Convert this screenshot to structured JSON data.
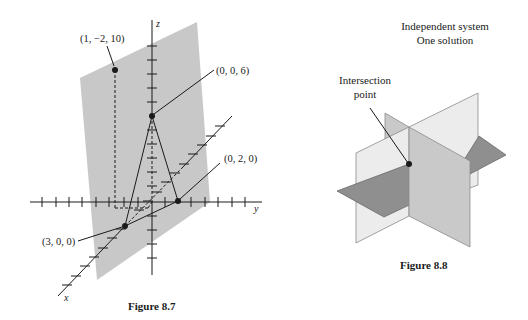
{
  "figure_8_7": {
    "caption": "Figure 8.7",
    "axes": {
      "x_label": "x",
      "y_label": "y",
      "z_label": "z"
    },
    "points": [
      {
        "label": "(1, −2, 10)",
        "coords": [
          1,
          -2,
          10
        ]
      },
      {
        "label": "(0, 0, 6)",
        "coords": [
          0,
          0,
          6
        ]
      },
      {
        "label": "(0,  2,  0)",
        "coords": [
          0,
          2,
          0
        ]
      },
      {
        "label": "(3, 0, 0)",
        "coords": [
          3,
          0,
          0
        ]
      }
    ],
    "colors": {
      "plane": "#c8c8c8",
      "ink": "#1a1a1a"
    }
  },
  "figure_8_8": {
    "caption": "Figure 8.8",
    "title_line1": "Independent system",
    "title_line2": "One solution",
    "annotation_line1": "Intersection",
    "annotation_line2": "point",
    "colors": {
      "light_plane": "#ececec",
      "mid_plane": "#c9c9c9",
      "dark_plane": "#8f8f8f"
    }
  }
}
